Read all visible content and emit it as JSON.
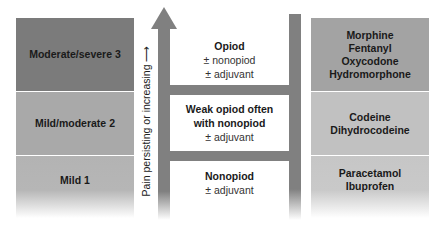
{
  "diagram": {
    "type": "pain-relief-ladder",
    "axis_label": "Pain persisting or increasing",
    "axis_arrow": "up",
    "colors": {
      "rail": "#808080",
      "left_level3": "#7b7b7b",
      "left_level2": "#a9a9a9",
      "left_level1": "#b3b3b3",
      "right_level3": "#a3a3a3",
      "right_level2": "#c1c1c1",
      "right_level1": "#c6c6c6"
    },
    "pain_levels": [
      {
        "label": "Moderate/severe 3"
      },
      {
        "label": "Mild/moderate 2"
      },
      {
        "label": "Mild 1"
      }
    ],
    "steps": [
      {
        "title": "Opiod",
        "lines": [
          "± nonopiod",
          "± adjuvant"
        ]
      },
      {
        "title": "Weak opiod often",
        "title2": "with nonopiod",
        "lines": [
          "± adjuvant"
        ]
      },
      {
        "title": "Nonopiod",
        "lines": [
          "± adjuvant"
        ]
      }
    ],
    "drugs": [
      {
        "items": [
          "Morphine",
          "Fentanyl",
          "Oxycodone",
          "Hydromorphone"
        ]
      },
      {
        "items": [
          "Codeine",
          "Dihydrocodeine"
        ]
      },
      {
        "items": [
          "Paracetamol",
          "Ibuprofen"
        ]
      }
    ]
  }
}
